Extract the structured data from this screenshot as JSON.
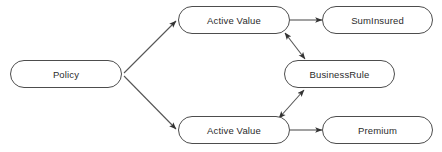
{
  "diagram": {
    "type": "node-edge-graph",
    "background_color": "#ffffff",
    "node_fill_color": "#ffffff",
    "node_stroke_color": "#4d4d4d",
    "edge_color": "#555555",
    "text_color": "#2b2b2b",
    "nodes": [
      {
        "id": "policy",
        "label": "Policy",
        "shape": "stadium",
        "x": 10,
        "y": 60,
        "w": 112,
        "h": 28
      },
      {
        "id": "active-value-top",
        "label": "Active Value",
        "shape": "stadium",
        "x": 178,
        "y": 6,
        "w": 112,
        "h": 28
      },
      {
        "id": "sum-insured",
        "label": "SumInsured",
        "shape": "stadium",
        "x": 322,
        "y": 6,
        "w": 111,
        "h": 28
      },
      {
        "id": "business-rule",
        "label": "BusinessRule",
        "shape": "stadium",
        "x": 284,
        "y": 60,
        "w": 111,
        "h": 28
      },
      {
        "id": "active-value-bottom",
        "label": "Active Value",
        "shape": "stadium",
        "x": 178,
        "y": 116,
        "w": 112,
        "h": 28
      },
      {
        "id": "premium",
        "label": "Premium",
        "shape": "stadium",
        "x": 322,
        "y": 116,
        "w": 111,
        "h": 28
      }
    ],
    "edges": [
      {
        "id": "policy-to-active-value-top",
        "from": "policy",
        "to": "active-value-top",
        "arrows": "end",
        "x1": 124,
        "y1": 73,
        "x2": 176,
        "y2": 21
      },
      {
        "id": "policy-to-active-value-bottom",
        "from": "policy",
        "to": "active-value-bottom",
        "arrows": "end",
        "x1": 124,
        "y1": 76,
        "x2": 176,
        "y2": 129
      },
      {
        "id": "active-value-top-to-sum-insured",
        "from": "active-value-top",
        "to": "sum-insured",
        "arrows": "end",
        "x1": 290,
        "y1": 20,
        "x2": 322,
        "y2": 20
      },
      {
        "id": "active-value-bottom-to-premium",
        "from": "active-value-bottom",
        "to": "premium",
        "arrows": "end",
        "x1": 290,
        "y1": 130,
        "x2": 322,
        "y2": 130
      },
      {
        "id": "active-value-top-business-rule",
        "from": "active-value-top",
        "to": "business-rule",
        "arrows": "both",
        "x1": 285,
        "y1": 33,
        "x2": 305,
        "y2": 59
      },
      {
        "id": "active-value-bottom-business-rule",
        "from": "active-value-bottom",
        "to": "business-rule",
        "arrows": "both",
        "x1": 279,
        "y1": 118,
        "x2": 304,
        "y2": 90
      }
    ]
  }
}
